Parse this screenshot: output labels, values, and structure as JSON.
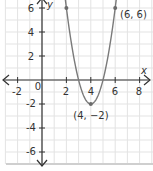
{
  "chart_data": {
    "type": "line",
    "title": "",
    "xlabel": "x",
    "ylabel": "y",
    "xlim": [
      -3.0,
      9.0
    ],
    "ylim": [
      -7.0,
      6.6
    ],
    "x_ticks": [
      -2,
      0,
      2,
      4,
      6,
      8
    ],
    "y_ticks": [
      -6,
      -4,
      -2,
      2,
      4,
      6
    ],
    "x_tick_labels": [
      "-2",
      "0",
      "2",
      "4",
      "6",
      "8"
    ],
    "y_tick_labels": [
      "-6",
      "-4",
      "-2",
      "2",
      "4",
      "6"
    ],
    "origin_label": "0",
    "grid": true,
    "legend": null,
    "series": [
      {
        "name": "parabola",
        "equation": "y = 2(x - 4)^2 - 2",
        "x": [
          1.95,
          2,
          2.5,
          3,
          3.5,
          4,
          4.5,
          5,
          5.5,
          6,
          6.05
        ],
        "y": [
          6.4,
          6,
          2.5,
          0,
          -1.5,
          -2,
          -1.5,
          0,
          2.5,
          6,
          6.4
        ]
      }
    ],
    "points": [
      {
        "x": 2,
        "y": 6,
        "label": ""
      },
      {
        "x": 6,
        "y": 6,
        "label": "(6, 6)"
      },
      {
        "x": 4,
        "y": -2,
        "label": "(4, −2)"
      }
    ],
    "annotations": [
      "(6, 6)",
      "(4, −2)"
    ]
  },
  "colors": {
    "grid": "#e3e3e3",
    "axis": "#333333",
    "curve": "#7a7a7a",
    "point": "#6b6b6b",
    "border": "#cfcfcf"
  },
  "labels": {
    "x_axis": "x",
    "y_axis": "y",
    "origin": "0",
    "x_ticks": [
      "-2",
      "2",
      "4",
      "6",
      "8"
    ],
    "y_ticks": [
      "6",
      "4",
      "2",
      "-2",
      "-4",
      "-6"
    ],
    "point_6_6": "(6, 6)",
    "point_4_neg2": "(4, −2)"
  }
}
